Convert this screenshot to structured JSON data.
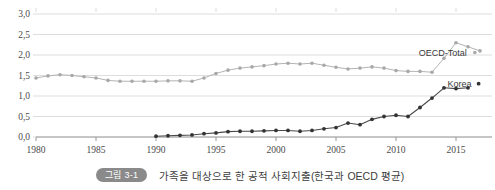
{
  "figure": {
    "badge": "그림 3-1",
    "caption": "가족을 대상으로 한 공적 사회지출(한국과 OECD 평균)"
  },
  "colors": {
    "oecd_line": "#b4b4b4",
    "oecd_marker": "#a8a8a8",
    "korea_line": "#4a4a4a",
    "korea_marker": "#333333",
    "grid": "#d9d9d9",
    "axis": "#8c8c8c",
    "text": "#4a4a4a",
    "badge_bg": "#8a8a8a"
  },
  "chart_data": {
    "type": "line",
    "title": "",
    "xlabel": "",
    "ylabel": "",
    "xlim": [
      1980,
      2018
    ],
    "ylim": [
      0.0,
      3.0
    ],
    "grid": true,
    "legend_position": "inline-right",
    "ytick_labels": [
      "0,0",
      "0,5",
      "1,0",
      "1,5",
      "2,0",
      "2,5",
      "3,0"
    ],
    "ytick_values": [
      0.0,
      0.5,
      1.0,
      1.5,
      2.0,
      2.5,
      3.0
    ],
    "xtick_labels": [
      "1980",
      "1985",
      "1990",
      "1995",
      "2000",
      "2005",
      "2010",
      "2015"
    ],
    "xtick_values": [
      1980,
      1985,
      1990,
      1995,
      2000,
      2005,
      2010,
      2015
    ],
    "series": [
      {
        "name": "OECD-Total",
        "label": "OECD-Total",
        "x": [
          1980,
          1981,
          1982,
          1983,
          1984,
          1985,
          1986,
          1987,
          1988,
          1989,
          1990,
          1991,
          1992,
          1993,
          1994,
          1995,
          1996,
          1997,
          1998,
          1999,
          2000,
          2001,
          2002,
          2003,
          2004,
          2005,
          2006,
          2007,
          2008,
          2009,
          2010,
          2011,
          2012,
          2013,
          2014,
          2015,
          2016,
          2017
        ],
        "values": [
          1.44,
          1.49,
          1.52,
          1.5,
          1.47,
          1.44,
          1.38,
          1.36,
          1.36,
          1.36,
          1.36,
          1.37,
          1.37,
          1.36,
          1.44,
          1.55,
          1.63,
          1.68,
          1.71,
          1.74,
          1.78,
          1.8,
          1.78,
          1.8,
          1.75,
          1.7,
          1.66,
          1.68,
          1.71,
          1.68,
          1.62,
          1.6,
          1.6,
          1.58,
          1.92,
          2.3,
          2.2,
          2.1
        ]
      },
      {
        "name": "Korea",
        "label": "Korea",
        "x": [
          1990,
          1991,
          1992,
          1993,
          1994,
          1995,
          1996,
          1997,
          1998,
          1999,
          2000,
          2001,
          2002,
          2003,
          2004,
          2005,
          2006,
          2007,
          2008,
          2009,
          2010,
          2011,
          2012,
          2013,
          2014,
          2015,
          2016
        ],
        "values": [
          0.02,
          0.03,
          0.04,
          0.05,
          0.08,
          0.1,
          0.13,
          0.14,
          0.14,
          0.15,
          0.16,
          0.16,
          0.14,
          0.16,
          0.2,
          0.23,
          0.34,
          0.3,
          0.43,
          0.5,
          0.53,
          0.5,
          0.72,
          0.95,
          1.2,
          1.18,
          1.2
        ]
      }
    ]
  }
}
